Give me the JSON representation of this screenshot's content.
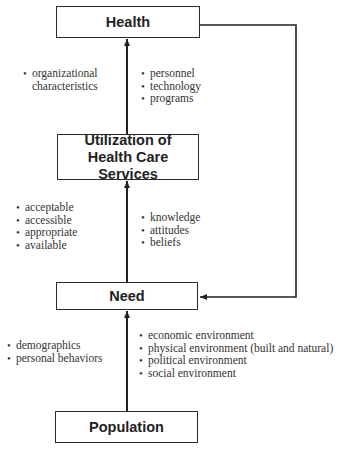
{
  "nodes": {
    "health": "Health",
    "utilization": "Utilization of Health Care Services",
    "need": "Need",
    "population": "Population"
  },
  "bullets": {
    "health_left": [
      "organizational",
      "characteristics"
    ],
    "health_right": [
      "personnel",
      "technology",
      "programs"
    ],
    "utilization_left": [
      "acceptable",
      "accessible",
      "appropriate",
      "available"
    ],
    "utilization_right": [
      "knowledge",
      "attitudes",
      "beliefs"
    ],
    "need_left": [
      "demographics",
      "personal behaviors"
    ],
    "need_right": [
      "economic environment",
      "physical environment (built and natural)",
      "political environment",
      "social environment"
    ]
  },
  "bullet_glyph": "•",
  "edges": [
    {
      "from": "Population",
      "to": "Need"
    },
    {
      "from": "Need",
      "to": "Utilization of Health Care Services"
    },
    {
      "from": "Utilization of Health Care Services",
      "to": "Health"
    },
    {
      "from": "Health",
      "to": "Need",
      "type": "feedback"
    }
  ]
}
